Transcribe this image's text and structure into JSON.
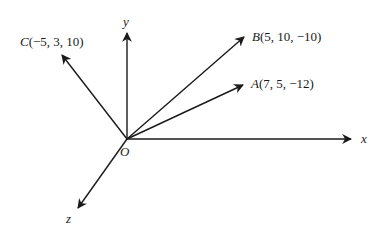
{
  "diagram": {
    "type": "3d-vector-axes",
    "origin": {
      "label": "O",
      "pos": [
        127,
        139
      ]
    },
    "axes": [
      {
        "name": "x",
        "label": "x",
        "from": [
          127,
          139
        ],
        "to": [
          351,
          139
        ]
      },
      {
        "name": "y",
        "label": "y",
        "from": [
          127,
          139
        ],
        "to": [
          127,
          33
        ]
      },
      {
        "name": "z",
        "label": "z",
        "from": [
          127,
          139
        ],
        "to": [
          78,
          208
        ]
      }
    ],
    "vectors": [
      {
        "name": "A",
        "point": "A",
        "coords": "(7, 5, −12)",
        "from": [
          127,
          139
        ],
        "to": [
          243,
          85
        ]
      },
      {
        "name": "B",
        "point": "B",
        "coords": "(5, 10, −10)",
        "from": [
          127,
          139
        ],
        "to": [
          244,
          37
        ]
      },
      {
        "name": "C",
        "point": "C",
        "coords": "(−5, 3, 10)",
        "from": [
          127,
          139
        ],
        "to": [
          62,
          55
        ]
      }
    ],
    "stroke_color": "#1a1a1a"
  }
}
